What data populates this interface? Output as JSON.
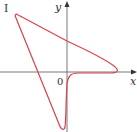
{
  "figure": {
    "panel_label": "I",
    "x_axis_label": "x",
    "y_axis_label": "y",
    "origin_label": "0",
    "colors": {
      "curve": "#d9434a",
      "axes": "#555555",
      "text": "#333333"
    },
    "curve_description": "Closed parametric curve: arrow/dart shape with vertices upper-left, right (on positive x-axis) and bottom (on negative y-axis), with cusp-like approach near origin"
  }
}
